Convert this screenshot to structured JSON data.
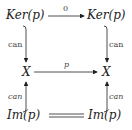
{
  "diagram": {
    "nodes": {
      "top_left": "Ker(p)",
      "top_right": "Ker(p)",
      "mid_left": "X",
      "mid_right": "X",
      "bottom_left": "Im(p)",
      "bottom_right": "Im(p)"
    },
    "edges": {
      "top": "0",
      "middle": "p",
      "left_upper": "can",
      "right_upper": "can",
      "left_lower": "can",
      "right_lower": "can",
      "bottom": "="
    }
  }
}
